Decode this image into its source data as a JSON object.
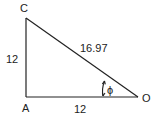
{
  "diagram": {
    "vertices": {
      "C": "C",
      "A": "A",
      "O": "O"
    },
    "sides": {
      "CA": "12",
      "AO": "12",
      "CO": "16.97"
    },
    "angle": {
      "symbol": "ϕ",
      "at": "O"
    },
    "colors": {
      "stroke": "#222222",
      "text": "#222222",
      "background": "#ffffff"
    }
  }
}
